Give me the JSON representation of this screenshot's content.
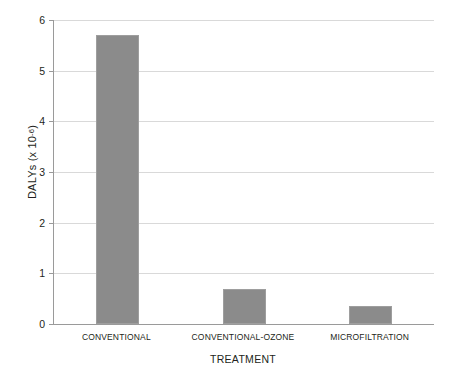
{
  "chart_data": {
    "type": "bar",
    "title": "",
    "xlabel": "TREATMENT",
    "ylabel": "DALYs (x 10",
    "ylabel_exponent": "-6",
    "ylabel_suffix": ")",
    "categories": [
      "CONVENTIONAL",
      "CONVENTIONAL-OZONE",
      "MICROFILTRATION"
    ],
    "values": [
      5.7,
      0.7,
      0.35
    ],
    "ylim": [
      0,
      6
    ],
    "yticks": [
      0,
      1,
      2,
      3,
      4,
      5,
      6
    ],
    "ytick_labels": [
      "0",
      "1",
      "2",
      "3",
      "4",
      "5",
      "6"
    ],
    "grid": true,
    "legend": "none",
    "bar_color": "#8b8b8b",
    "grid_color": "#d9d9d9",
    "axis_color": "#9a9a9a"
  }
}
